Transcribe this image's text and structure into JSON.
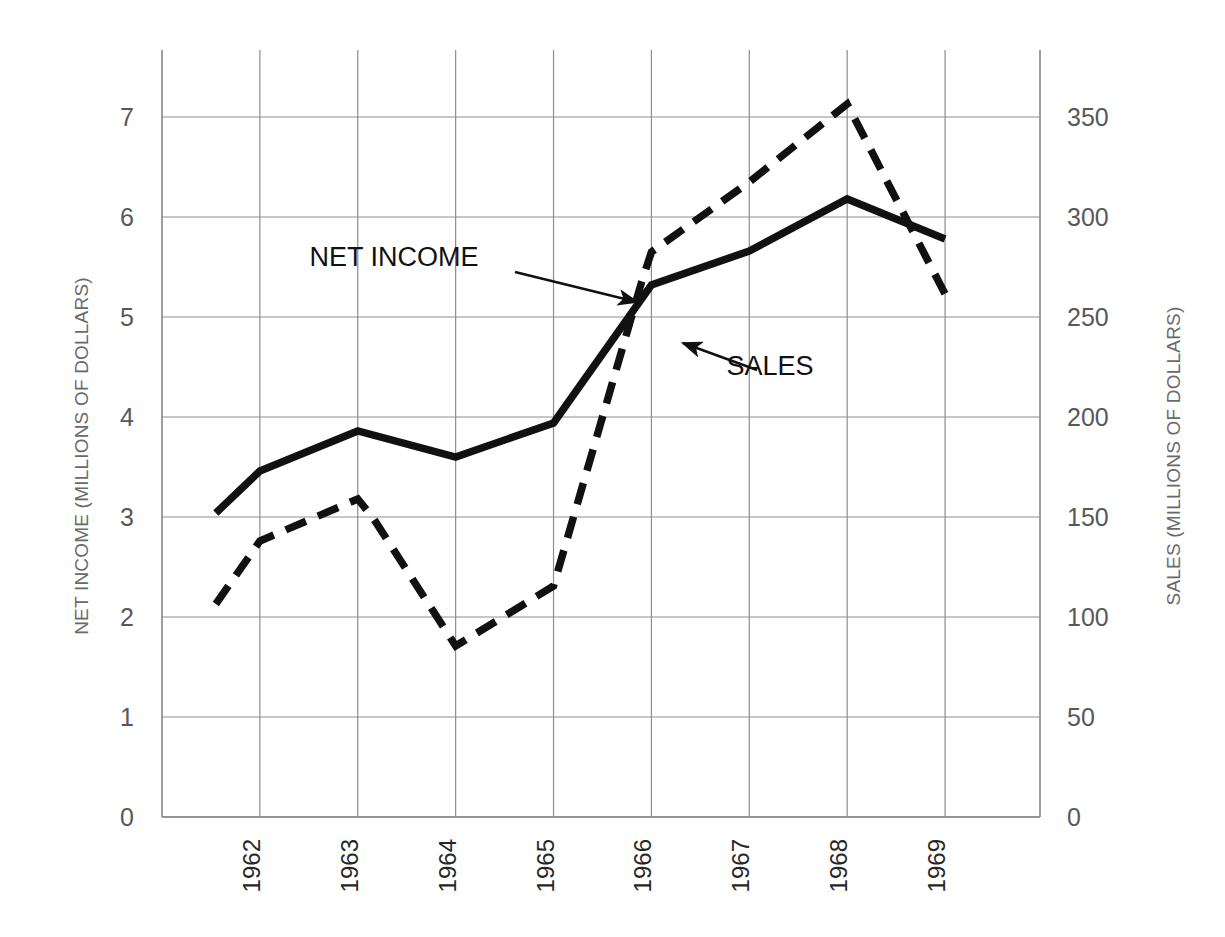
{
  "chart_data": {
    "type": "line",
    "title": "",
    "xlabel": "",
    "categories": [
      "1962",
      "1963",
      "1964",
      "1965",
      "1966",
      "1967",
      "1968",
      "1969"
    ],
    "x_tick_labels": [
      "1962",
      "1963",
      "1964",
      "1965",
      "1966",
      "1967",
      "1968",
      "1969"
    ],
    "x_tick_rotation": -90,
    "grid": true,
    "legend_position": "inline-annotations",
    "axes": {
      "left": {
        "label": "NET INCOME (MILLIONS OF DOLLARS)",
        "ticks": [
          "0",
          "1",
          "2",
          "3",
          "4",
          "5",
          "6",
          "7"
        ],
        "tick_values": [
          0,
          1,
          2,
          3,
          4,
          5,
          6,
          7
        ],
        "ylim": [
          0,
          7.6
        ]
      },
      "right": {
        "label": "SALES (MILLIONS OF DOLLARS)",
        "ticks": [
          "0",
          "50",
          "100",
          "150",
          "200",
          "250",
          "300",
          "350"
        ],
        "tick_values": [
          0,
          50,
          100,
          150,
          200,
          250,
          300,
          350
        ],
        "ylim": [
          0,
          380
        ]
      }
    },
    "series": [
      {
        "name": "SALES",
        "axis": "right",
        "style": "solid",
        "color": "#111111",
        "x": [
          1961.55,
          1962,
          1963,
          1964,
          1965,
          1966,
          1967,
          1968,
          1969
        ],
        "values": [
          152,
          173,
          193,
          180,
          197,
          266,
          283,
          309,
          289
        ]
      },
      {
        "name": "NET INCOME",
        "axis": "left",
        "style": "dashed",
        "color": "#111111",
        "x": [
          1961.55,
          1962,
          1963,
          1963.15,
          1964,
          1965,
          1965.9,
          1966,
          1967,
          1968,
          1969
        ],
        "values": [
          2.13,
          2.76,
          3.18,
          3.0,
          1.71,
          2.31,
          5.35,
          5.65,
          6.35,
          7.13,
          5.23
        ]
      }
    ],
    "annotations": [
      {
        "text": "NET INCOME",
        "points_to_series": "NET INCOME",
        "label_x": 394,
        "label_y": 266,
        "arrow_from": [
          515,
          272
        ],
        "arrow_to": [
          637,
          302
        ]
      },
      {
        "text": "SALES",
        "points_to_series": "SALES",
        "label_x": 770,
        "label_y": 375,
        "arrow_from": [
          757,
          370
        ],
        "arrow_to": [
          683,
          343
        ]
      }
    ]
  },
  "labels": {
    "left_axis_title": "NET INCOME (MILLIONS OF DOLLARS)",
    "right_axis_title": "SALES (MILLIONS OF DOLLARS)",
    "annotation_net_income": "NET INCOME",
    "annotation_sales": "SALES"
  }
}
